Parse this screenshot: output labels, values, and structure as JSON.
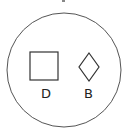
{
  "diagram": {
    "container": {
      "shape": "circle",
      "stroke": "#555555"
    },
    "top_fragment": {
      "shape": "partial-glyph",
      "color": "#666666"
    },
    "items": [
      {
        "shape": "square",
        "label": "D"
      },
      {
        "shape": "diamond",
        "label": "B"
      }
    ]
  }
}
